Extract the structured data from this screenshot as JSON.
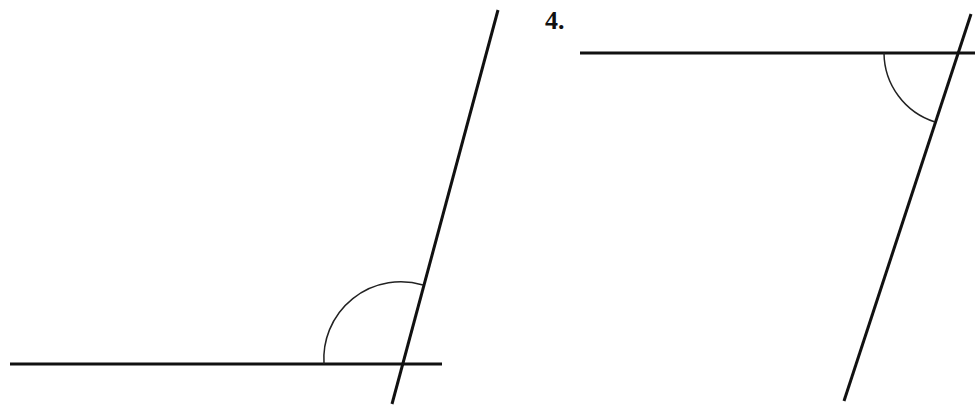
{
  "figures": [
    {
      "id": "figure-3-left",
      "label": "",
      "horizontal_line": {
        "x1": 10,
        "y1": 364,
        "x2": 442,
        "y2": 364
      },
      "transversal": {
        "x1": 498,
        "y1": 10,
        "x2": 392,
        "y2": 404
      },
      "angle_arc": {
        "cx": 401,
        "cy": 364,
        "r": 77,
        "start": {
          "x": 324,
          "y": 364
        },
        "end": {
          "x": 423,
          "y": 285
        },
        "marked": "obtuse angle"
      }
    },
    {
      "id": "figure-4-right",
      "label": "4.",
      "horizontal_line": {
        "x1": 580,
        "y1": 53,
        "x2": 975,
        "y2": 53
      },
      "transversal": {
        "x1": 971,
        "y1": 14,
        "x2": 844,
        "y2": 401
      },
      "angle_arc": {
        "cx": 957,
        "cy": 53,
        "r": 73,
        "start": {
          "x": 884,
          "y": 53
        },
        "end": {
          "x": 935,
          "y": 122
        },
        "marked": "acute angle"
      }
    }
  ],
  "colors": {
    "line": "#111111",
    "arc": "#222222",
    "background": "#ffffff"
  }
}
